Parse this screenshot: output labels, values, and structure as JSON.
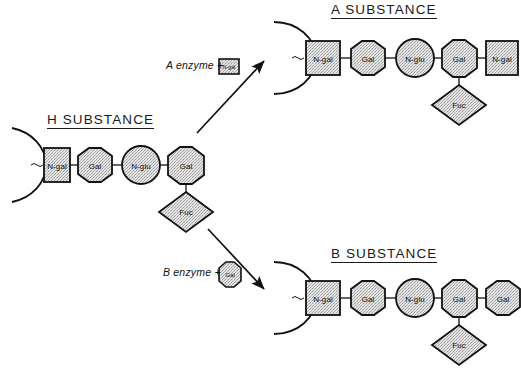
{
  "figure": {
    "background_color": "#ffffff",
    "stroke_color": "#111111",
    "fill_color": "#d9d9d9",
    "title_h": "H SUBSTANCE",
    "title_a": "A  SUBSTANCE",
    "title_b": "B  SUBSTANCE"
  },
  "labels": {
    "n_gal": "N-gal",
    "gal": "Gal",
    "n_glu": "N-glu",
    "fuc": "Fuc"
  },
  "reactions": {
    "a": {
      "text": "A enzyme +",
      "added_residue": "N-gal",
      "added_shape": "square"
    },
    "b": {
      "text": "B enzyme +",
      "added_residue": "Gal",
      "added_shape": "octagon"
    }
  },
  "chains": {
    "h": {
      "name": "H SUBSTANCE",
      "backbone": [
        {
          "residue": "N-gal",
          "shape": "square"
        },
        {
          "residue": "Gal",
          "shape": "octagon"
        },
        {
          "residue": "N-glu",
          "shape": "circle"
        },
        {
          "residue": "Gal",
          "shape": "octagon"
        }
      ],
      "branch": {
        "residue": "Fuc",
        "shape": "diamond",
        "attached_to_index": 3
      }
    },
    "a": {
      "name": "A SUBSTANCE",
      "backbone": [
        {
          "residue": "N-gal",
          "shape": "square"
        },
        {
          "residue": "Gal",
          "shape": "octagon"
        },
        {
          "residue": "N-glu",
          "shape": "circle"
        },
        {
          "residue": "Gal",
          "shape": "octagon"
        },
        {
          "residue": "N-gal",
          "shape": "square"
        }
      ],
      "branch": {
        "residue": "Fuc",
        "shape": "diamond",
        "attached_to_index": 3
      }
    },
    "b": {
      "name": "B SUBSTANCE",
      "backbone": [
        {
          "residue": "N-gal",
          "shape": "square"
        },
        {
          "residue": "Gal",
          "shape": "octagon"
        },
        {
          "residue": "N-glu",
          "shape": "circle"
        },
        {
          "residue": "Gal",
          "shape": "octagon"
        },
        {
          "residue": "Gal",
          "shape": "octagon"
        }
      ],
      "branch": {
        "residue": "Fuc",
        "shape": "diamond",
        "attached_to_index": 3
      }
    }
  }
}
